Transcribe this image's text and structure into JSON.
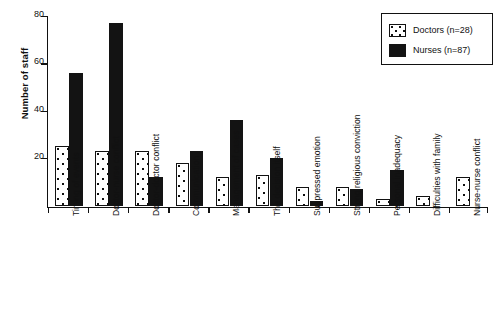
{
  "chart_data": {
    "type": "bar",
    "title": "",
    "xlabel": "",
    "ylabel": "Number of staff",
    "ylim": [
      0,
      80
    ],
    "yticks": [
      0,
      20,
      40,
      60,
      80
    ],
    "ytick_labels": [
      "20",
      "40",
      "60",
      "80"
    ],
    "grid": false,
    "legend_position": "top-right",
    "categories": [
      "Timing of events",
      "Doctor-nurse conflict",
      "Doctor-doctor conflict",
      "Communication",
      "Management of cases",
      "The decision itself",
      "Suppressed emotion",
      "Strong religious conviction",
      "Personal inadequacy",
      "Difficulties with family",
      "Nurse-nurse conflict"
    ],
    "series": [
      {
        "name": "Doctors (n=28)",
        "style": "white-dotted",
        "values": [
          25,
          23,
          23,
          18,
          12,
          13,
          8,
          8,
          3,
          4,
          12
        ]
      },
      {
        "name": "Nurses (n=87)",
        "style": "solid-black",
        "values": [
          56,
          77,
          12,
          23,
          36,
          20,
          2,
          7,
          15,
          0,
          0
        ]
      }
    ]
  },
  "legend": {
    "items": [
      {
        "label": "Doctors (n=28)",
        "swatch": "dotted-white-swatch"
      },
      {
        "label": "Nurses (n=87)",
        "swatch": "solid-black-swatch"
      }
    ]
  },
  "colors": {
    "axis": "#111111",
    "nurses_fill": "#131313",
    "doctors_fill": "#ffffff",
    "background": "#ffffff"
  }
}
